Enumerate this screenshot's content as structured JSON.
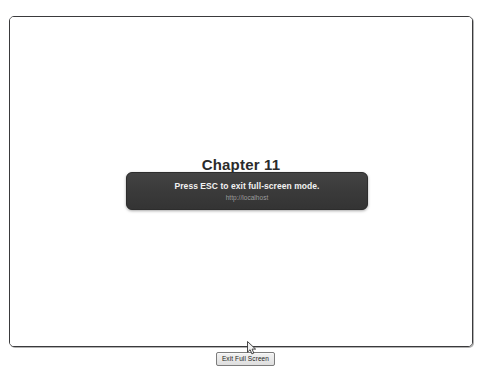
{
  "window": {
    "background_color": "#ffffff",
    "frame_border_color": "#3a3a3c"
  },
  "document": {
    "heading": "Chapter 11",
    "background_color": "#ffffff"
  },
  "fullscreen_toast": {
    "message": "Press ESC to exit full-screen mode.",
    "url": "http://localhost",
    "background_color": "#3b3b3b",
    "message_color": "#f2f2f2",
    "url_color": "#9d9d9d"
  },
  "exit_bar": {
    "button_label": "Exit Full Screen"
  },
  "cursor": {
    "icon": "arrow-pointer-icon"
  }
}
